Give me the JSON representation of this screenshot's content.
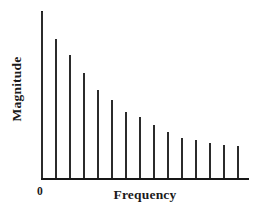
{
  "chart_data": {
    "type": "bar",
    "title": "",
    "subtitle": "",
    "xlabel": "Frequency",
    "ylabel": "Magnitude",
    "origin_label": "0",
    "grid": false,
    "legend": null,
    "axis_color": "#171717",
    "stem_color": "#2b2b2b",
    "background": "#ffffff",
    "xlim": [
      0,
      16
    ],
    "ylim": [
      0,
      100
    ],
    "xticks": [],
    "yticks": [],
    "categories": [
      "1",
      "2",
      "3",
      "4",
      "5",
      "6",
      "7",
      "8",
      "9",
      "10",
      "11",
      "12",
      "13",
      "14",
      "15"
    ],
    "values": [
      100,
      84,
      74,
      63,
      53,
      47,
      40,
      37,
      32,
      28,
      24,
      23,
      21,
      20,
      19
    ]
  },
  "axes": {
    "x_label": "Frequency",
    "y_label": "Magnitude",
    "origin": "0"
  }
}
